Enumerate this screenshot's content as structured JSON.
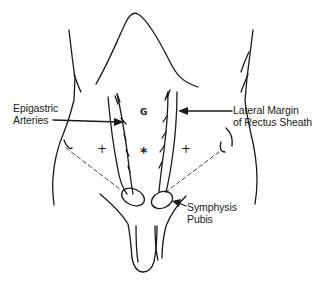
{
  "figure": {
    "type": "anatomical line drawing",
    "labels": {
      "epigastric_arteries_line1": "Epigastric",
      "epigastric_arteries_line2": "Arteries",
      "lateral_margin_line1": "Lateral Margin",
      "lateral_margin_line2": "of Rectus Sheath",
      "symphysis_line1": "Symphysis",
      "symphysis_line2": "Pubis"
    },
    "markers": {
      "upper_center": "G",
      "left": "+",
      "center": "*",
      "right": "+"
    },
    "colors": {
      "ink": "#1a1a1a",
      "background": "#ffffff"
    }
  }
}
